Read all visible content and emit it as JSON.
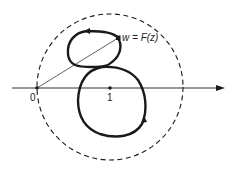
{
  "diagram": {
    "labels": {
      "origin": "0",
      "one": "1",
      "w_prefix": "w = ",
      "w_func": "F",
      "w_arg": "(z)"
    },
    "elements": {
      "real_axis": "horizontal axis with arrow to the right",
      "dashed_circle": "dashed circle centered at 1 passing through 0",
      "curve": "closed figure-eight curve w = F(z) with direction arrows",
      "radius_line": "thin line from 0 to point w"
    },
    "colors": {
      "stroke": "#1a1a1a",
      "background": "#ffffff"
    }
  }
}
